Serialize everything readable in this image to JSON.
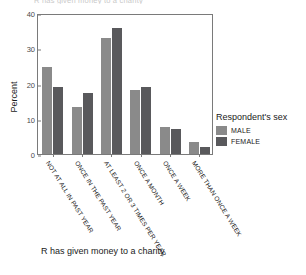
{
  "clipped_title": "R has given money to a charity",
  "caption": "R has given money to a charity",
  "axes": {
    "ylabel": "Percent",
    "yticks": [
      "0",
      "10",
      "20",
      "30",
      "40"
    ],
    "xlabel": ""
  },
  "legend": {
    "title": "Respondent's sex",
    "entries": [
      {
        "label": "MALE",
        "color": "#8a8a8a"
      },
      {
        "label": "FEMALE",
        "color": "#59595c"
      }
    ]
  },
  "chart_data": {
    "type": "bar",
    "title": "R has given money to a charity",
    "xlabel": "R has given money to a charity",
    "ylabel": "Percent",
    "ylim": [
      0,
      40
    ],
    "yticks": [
      0,
      10,
      20,
      30,
      40
    ],
    "grid": false,
    "legend_position": "right",
    "legend_title": "Respondent's sex",
    "categories": [
      "NOT AT ALL IN PAST YEAR",
      "ONCE IN THE PAST YEAR",
      "AT LEAST 2 OR 3 TIMES PER YEAR",
      "ONCE A MONTH",
      "ONCE A WEEK",
      "MORE THAN ONCE A WEEK"
    ],
    "series": [
      {
        "name": "MALE",
        "color": "#8a8a8a",
        "values": [
          24.7,
          13.4,
          33.0,
          18.2,
          7.8,
          3.3
        ]
      },
      {
        "name": "FEMALE",
        "color": "#59595c",
        "values": [
          19.1,
          17.3,
          35.7,
          19.1,
          7.1,
          1.9
        ]
      }
    ]
  }
}
